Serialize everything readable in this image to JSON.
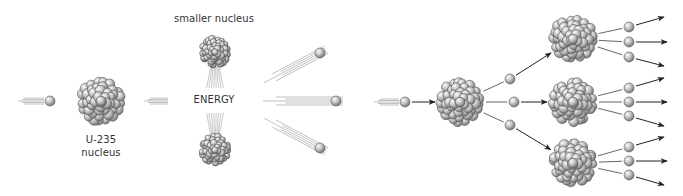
{
  "labels": {
    "u235": "U-235",
    "nucleus": "nucleus",
    "smaller_nucleus": "smaller nucleus",
    "energy": "ENERGY"
  },
  "colors": {
    "ball_light": "#f2f2f2",
    "ball_mid": "#b5b5b5",
    "ball_dark": "#6e6e6e",
    "ball_stroke": "#555555",
    "trail": "#b0b0b0",
    "arrow": "#222222",
    "line": "#555555"
  },
  "panel_fission": {
    "incoming_neutron": {
      "x": 50,
      "y": 101,
      "r": 5
    },
    "incoming_trail": {
      "x1": 18,
      "x2": 44,
      "y": 101
    },
    "u235_nucleus": {
      "x": 101,
      "y": 101,
      "r": 24
    },
    "after_trail": {
      "x1": 144,
      "x2": 168,
      "y": 101
    },
    "smaller_nucleus_top": {
      "x": 215,
      "y": 52,
      "r": 16
    },
    "smaller_nucleus_bottom": {
      "x": 215,
      "y": 150,
      "r": 16
    },
    "released_neutrons": [
      {
        "x": 320,
        "y": 53,
        "r": 5,
        "trail_dx": -62,
        "trail_dy": 33
      },
      {
        "x": 336,
        "y": 101,
        "r": 5,
        "trail_dx": -80,
        "trail_dy": 0
      },
      {
        "x": 320,
        "y": 148,
        "r": 5,
        "trail_dx": -62,
        "trail_dy": -33
      }
    ]
  },
  "panel_chain": {
    "incoming_neutron": {
      "x": 405,
      "y": 102,
      "r": 5
    },
    "incoming_trail": {
      "x1": 374,
      "x2": 399,
      "y": 102
    },
    "first_nucleus": {
      "x": 460,
      "y": 102,
      "r": 24
    },
    "gen1_neutrons": [
      {
        "x": 510,
        "y": 79
      },
      {
        "x": 514,
        "y": 102
      },
      {
        "x": 510,
        "y": 125
      }
    ],
    "gen2_nuclei": [
      {
        "x": 573,
        "y": 39,
        "r": 24
      },
      {
        "x": 573,
        "y": 102,
        "r": 24
      },
      {
        "x": 573,
        "y": 163,
        "r": 24
      }
    ],
    "gen2_neutrons": [
      [
        {
          "x": 629,
          "y": 27,
          "ax": 664,
          "ay": 17
        },
        {
          "x": 629,
          "y": 42,
          "ax": 667,
          "ay": 42
        },
        {
          "x": 629,
          "y": 57,
          "ax": 664,
          "ay": 66
        }
      ],
      [
        {
          "x": 629,
          "y": 88,
          "ax": 664,
          "ay": 78
        },
        {
          "x": 629,
          "y": 102,
          "ax": 667,
          "ay": 102
        },
        {
          "x": 629,
          "y": 116,
          "ax": 664,
          "ay": 126
        }
      ],
      [
        {
          "x": 629,
          "y": 147,
          "ax": 664,
          "ay": 137
        },
        {
          "x": 629,
          "y": 161,
          "ax": 667,
          "ay": 161
        },
        {
          "x": 629,
          "y": 175,
          "ax": 664,
          "ay": 185
        }
      ]
    ]
  }
}
